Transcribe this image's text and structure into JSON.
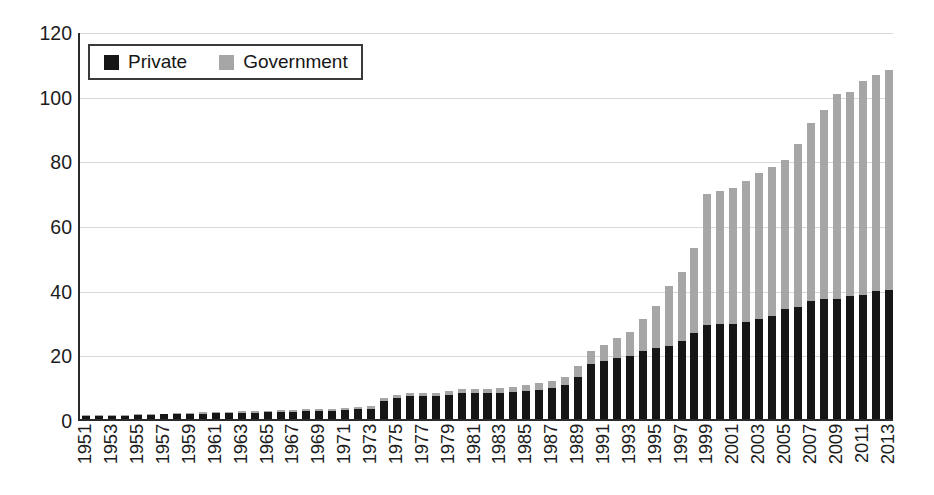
{
  "chart_data": {
    "type": "bar",
    "stacked": true,
    "title": "",
    "xlabel": "",
    "ylabel": "",
    "ylim": [
      0,
      120
    ],
    "ytick_step": 20,
    "yticks": [
      "0",
      "20",
      "40",
      "60",
      "80",
      "100",
      "120"
    ],
    "grid": true,
    "legend_position": "top-left",
    "categories": [
      "1951",
      "1952",
      "1953",
      "1954",
      "1955",
      "1956",
      "1957",
      "1958",
      "1959",
      "1960",
      "1961",
      "1962",
      "1963",
      "1964",
      "1965",
      "1966",
      "1967",
      "1968",
      "1969",
      "1970",
      "1971",
      "1972",
      "1973",
      "1974",
      "1975",
      "1976",
      "1977",
      "1978",
      "1979",
      "1980",
      "1981",
      "1982",
      "1983",
      "1984",
      "1985",
      "1986",
      "1987",
      "1988",
      "1989",
      "1990",
      "1991",
      "1992",
      "1993",
      "1994",
      "1995",
      "1996",
      "1997",
      "1998",
      "1999",
      "2000",
      "2001",
      "2002",
      "2003",
      "2004",
      "2005",
      "2006",
      "2007",
      "2008",
      "2009",
      "2010",
      "2011",
      "2012",
      "2013"
    ],
    "xtick_labels": [
      "1951",
      "1953",
      "1955",
      "1957",
      "1959",
      "1961",
      "1963",
      "1965",
      "1967",
      "1969",
      "1971",
      "1973",
      "1975",
      "1977",
      "1979",
      "1981",
      "1983",
      "1985",
      "1987",
      "1989",
      "1991",
      "1993",
      "1995",
      "1997",
      "1999",
      "2001",
      "2003",
      "2005",
      "2007",
      "2009",
      "2011",
      "2013"
    ],
    "series": [
      {
        "name": "Private",
        "color": "#161616",
        "values": [
          1,
          1,
          1,
          1,
          1.2,
          1.3,
          1.4,
          1.5,
          1.6,
          1.7,
          1.8,
          1.9,
          2,
          2,
          2.1,
          2.2,
          2.3,
          2.4,
          2.5,
          2.6,
          2.8,
          3,
          3.2,
          5.5,
          6.5,
          7,
          7,
          7,
          7.5,
          8,
          8,
          8,
          8.2,
          8.4,
          8.6,
          9,
          9.5,
          10.5,
          13,
          17,
          18,
          19,
          19.5,
          21,
          22,
          22.5,
          24,
          26.5,
          29,
          29.5,
          29.5,
          30,
          31,
          32,
          34,
          34.5,
          36.5,
          37,
          37,
          38,
          38.5,
          39.5,
          40
        ]
      },
      {
        "name": "Government",
        "color": "#a6a6a6",
        "values": [
          0.2,
          0.2,
          0.2,
          0.2,
          0.3,
          0.3,
          0.3,
          0.3,
          0.4,
          0.4,
          0.4,
          0.4,
          0.5,
          0.5,
          0.5,
          0.5,
          0.5,
          0.6,
          0.6,
          0.6,
          0.6,
          0.7,
          0.8,
          1,
          1,
          1,
          1,
          1,
          1.2,
          1.3,
          1.3,
          1.4,
          1.5,
          1.6,
          1.8,
          2,
          2.2,
          2.5,
          3.5,
          4,
          5,
          6,
          7.5,
          10,
          13,
          18.5,
          21.5,
          26.5,
          40.5,
          41,
          42,
          43.5,
          45,
          46,
          46,
          50.5,
          55,
          58.5,
          63.5,
          63,
          66,
          67,
          68
        ]
      }
    ],
    "totals": [
      1.2,
      1.2,
      1.2,
      1.2,
      1.5,
      1.6,
      1.7,
      1.8,
      2,
      2.1,
      2.2,
      2.3,
      2.5,
      2.5,
      2.6,
      2.7,
      2.8,
      3,
      3.1,
      3.2,
      3.4,
      3.7,
      4,
      6.5,
      7.5,
      8,
      8,
      8,
      8.7,
      9.3,
      9.3,
      9.4,
      9.7,
      10,
      10.4,
      11,
      11.7,
      13,
      16.5,
      21,
      23,
      25,
      27,
      31,
      35,
      41,
      45.5,
      53,
      69.5,
      70.5,
      71.5,
      73.5,
      76,
      78,
      80,
      85,
      91.5,
      95.5,
      100.5,
      101,
      104.5,
      106.5,
      108
    ]
  },
  "legend": {
    "items": [
      {
        "label": "Private",
        "swatch": "black-square-swatch"
      },
      {
        "label": "Government",
        "swatch": "gray-square-swatch"
      }
    ]
  }
}
